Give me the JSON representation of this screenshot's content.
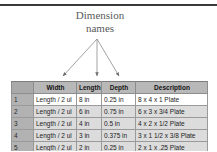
{
  "annotation": {
    "text": "Dimension\nnames",
    "arrow_targets": [
      "Width",
      "Length",
      "Depth"
    ]
  },
  "table": {
    "columns": [
      "",
      "Width",
      "Length",
      "Depth",
      "Description"
    ],
    "rows": [
      {
        "number": "1",
        "width": "Length / 2 ul",
        "length": "8 in",
        "depth": "0.25 in",
        "description": "8 x 4 x 1 Plate"
      },
      {
        "number": "2",
        "width": "Length / 2 ul",
        "length": "6 in",
        "depth": "0.75 in",
        "description": "6 x 3 x 3/4 Plate"
      },
      {
        "number": "3",
        "width": "Length / 2 ul",
        "length": "4 in",
        "depth": "0.5 in",
        "description": "4 x 2 x 1/2 Plate"
      },
      {
        "number": "4",
        "width": "Length / 2 ul",
        "length": "3 in",
        "depth": "0.375 in",
        "description": "3 x 1 1/2 x 3/8 Plate"
      },
      {
        "number": "5",
        "width": "Length / 2 ul",
        "length": "2 in",
        "depth": "0.25 in",
        "description": "2 x 1 x .25 Plate"
      }
    ]
  },
  "colors": {
    "header_bg": "#b8b8b8",
    "gutter_bg": "#b2b2b2",
    "row_alt_bg": "#dcdcdc",
    "row_bg": "#ffffff",
    "grid_line": "#9a9a9a",
    "annotation_text": "#58595b",
    "rule": "#3a3a3a"
  }
}
